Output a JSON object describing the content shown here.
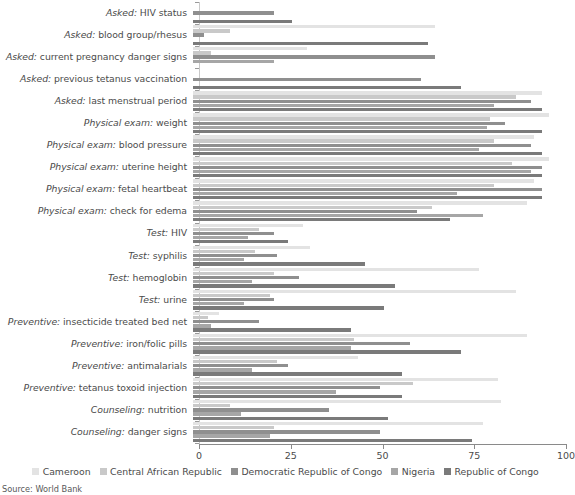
{
  "chart_data": {
    "type": "bar",
    "orientation": "horizontal",
    "title": "",
    "xlabel": "",
    "ylabel": "",
    "xlim": [
      0,
      100
    ],
    "xticks": [
      0,
      25,
      50,
      75,
      100
    ],
    "grid": false,
    "legend_position": "bottom",
    "source": "Source: World Bank",
    "categories": [
      "Asked: HIV status",
      "Asked: blood group/rhesus",
      "Asked: current pregnancy danger signs",
      "Asked: previous tetanus vaccination",
      "Asked: last menstrual period",
      "Physical exam: weight",
      "Physical exam: blood pressure",
      "Physical exam: uterine height",
      "Physical exam: fetal heartbeat",
      "Physical exam: check for edema",
      "Test: HIV",
      "Test: syphilis",
      "Test: hemoglobin",
      "Test: urine",
      "Preventive: insecticide treated bed net",
      "Preventive: iron/folic pills",
      "Preventive: antimalarials",
      "Preventive: tetanus toxoid injection",
      "Counseling: nutrition",
      "Counseling: danger signs"
    ],
    "category_prefixes": [
      "Asked:",
      "Asked:",
      "Asked:",
      "Asked:",
      "Asked:",
      "Physical exam:",
      "Physical exam:",
      "Physical exam:",
      "Physical exam:",
      "Physical exam:",
      "Test:",
      "Test:",
      "Test:",
      "Test:",
      "Preventive:",
      "Preventive:",
      "Preventive:",
      "Preventive:",
      "Counseling:",
      "Counseling:"
    ],
    "category_suffixes": [
      " HIV status",
      " blood group/rhesus",
      " current pregnancy danger signs",
      " previous tetanus vaccination",
      " last menstrual period",
      " weight",
      " blood pressure",
      " uterine height",
      " fetal heartbeat",
      " check for edema",
      " HIV",
      " syphilis",
      " hemoglobin",
      " urine",
      " insecticide treated bed net",
      " iron/folic pills",
      " antimalarials",
      " tetanus toxoid injection",
      " nutrition",
      " danger signs"
    ],
    "series": [
      {
        "name": "Cameroon",
        "color": "#e3e3e3",
        "values": [
          0,
          66,
          31,
          0,
          95,
          97,
          93,
          97,
          93,
          91,
          30,
          32,
          78,
          88,
          7,
          91,
          45,
          83,
          84,
          79
        ]
      },
      {
        "name": "Central African Republic",
        "color": "#c9c9c9",
        "values": [
          0,
          10,
          5,
          0,
          88,
          81,
          82,
          87,
          82,
          65,
          18,
          17,
          22,
          21,
          4,
          44,
          23,
          60,
          10,
          22
        ]
      },
      {
        "name": "Democratic Republic of Congo",
        "color": "#8f8f8f",
        "values": [
          22,
          3,
          66,
          62,
          92,
          85,
          92,
          95,
          95,
          61,
          22,
          23,
          29,
          22,
          18,
          59,
          26,
          51,
          37,
          51
        ]
      },
      {
        "name": "Nigeria",
        "color": "#a6a6a6",
        "values": [
          0,
          0,
          22,
          0,
          82,
          80,
          78,
          92,
          72,
          79,
          15,
          14,
          16,
          14,
          5,
          43,
          16,
          39,
          13,
          21
        ]
      },
      {
        "name": "Republic of Congo",
        "color": "#7a7a7a",
        "values": [
          27,
          64,
          0,
          73,
          95,
          95,
          95,
          95,
          95,
          70,
          26,
          47,
          55,
          52,
          43,
          73,
          57,
          57,
          53,
          76
        ]
      }
    ]
  },
  "legend": {
    "items": [
      {
        "label": "Cameroon",
        "color": "#e3e3e3"
      },
      {
        "label": "Central African Republic",
        "color": "#c9c9c9"
      },
      {
        "label": "Democratic Republic of Congo",
        "color": "#8f8f8f"
      },
      {
        "label": "Nigeria",
        "color": "#a6a6a6"
      },
      {
        "label": "Republic of Congo",
        "color": "#7a7a7a"
      }
    ]
  },
  "axis": {
    "tick_labels": [
      "0",
      "25",
      "50",
      "75",
      "100"
    ]
  },
  "footer": {
    "source": "Source: World Bank"
  }
}
